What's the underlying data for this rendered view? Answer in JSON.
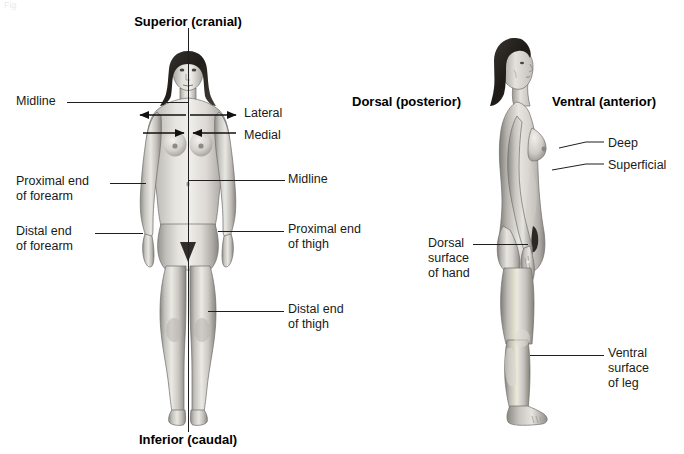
{
  "figure": {
    "title_fragment": "Fig",
    "domain": "anatomy-directional-terms-diagram"
  },
  "anterior_view": {
    "superior_heading": "Superior (cranial)",
    "inferior_heading": "Inferior (caudal)",
    "labels": {
      "midline_left": "Midline",
      "midline_right": "Midline",
      "lateral": "Lateral",
      "medial": "Medial",
      "proximal_forearm": "Proximal end\nof forearm",
      "distal_forearm": "Distal end\nof forearm",
      "proximal_thigh": "Proximal end\nof thigh",
      "distal_thigh": "Distal end\nof thigh"
    }
  },
  "lateral_view": {
    "dorsal_heading": "Dorsal (posterior)",
    "ventral_heading": "Ventral (anterior)",
    "labels": {
      "deep": "Deep",
      "superficial": "Superficial",
      "dorsal_hand": "Dorsal\nsurface\nof hand",
      "ventral_leg": "Ventral\nsurface\nof leg"
    }
  },
  "colors": {
    "background": "#ffffff",
    "text": "#1a1a1a",
    "leader_line": "#1f1f1f",
    "skin_light": "#f0efee",
    "skin_mid": "#c9c7c5",
    "skin_dark": "#8e8c8a",
    "shadow": "#6e6c6a",
    "hair": "#2a2724",
    "outline": "#6f6d6b"
  }
}
